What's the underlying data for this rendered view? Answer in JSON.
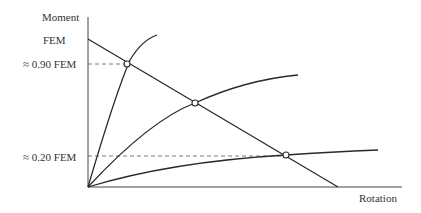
{
  "diagram": {
    "type": "moment-rotation",
    "axes": {
      "y_label": "Moment",
      "x_label": "Rotation"
    },
    "y_marks": [
      {
        "label": "FEM"
      },
      {
        "label": "≈ 0.90 FEM"
      },
      {
        "label": "≈ 0.20 FEM"
      }
    ],
    "lines": [
      {
        "name": "beam-line",
        "description": "Straight line from FEM on moment axis down to rotation axis"
      },
      {
        "name": "stiff-connection-curve",
        "description": "Steep curve intersecting beam line at ≈ 0.90 FEM"
      },
      {
        "name": "semi-rigid-connection-curve",
        "description": "Medium curve intersecting beam line near mid-point"
      },
      {
        "name": "flexible-connection-curve",
        "description": "Shallow curve intersecting beam line at ≈ 0.20 FEM"
      }
    ],
    "intersections": 3,
    "colors": {
      "line": "#333333",
      "background": "#ffffff"
    }
  }
}
